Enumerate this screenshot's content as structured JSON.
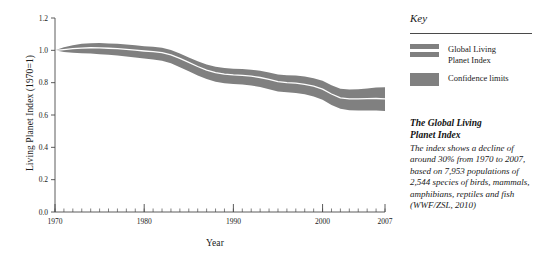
{
  "chart_data": {
    "type": "area",
    "title": "",
    "xlabel": "Year",
    "ylabel": "Living Planet Index (1970=1)",
    "xlim": [
      1970,
      2007
    ],
    "ylim": [
      0.0,
      1.2
    ],
    "grid": false,
    "legend_position": "right",
    "x_ticks": [
      "1970",
      "1980",
      "1990",
      "2000",
      "2007"
    ],
    "x_tick_values": [
      1970,
      1980,
      1990,
      2000,
      2007
    ],
    "x_minor_tick_step": 1,
    "y_ticks": [
      "0.0",
      "0.2",
      "0.4",
      "0.6",
      "0.8",
      "1.0",
      "1.2"
    ],
    "y_tick_values": [
      0.0,
      0.2,
      0.4,
      0.6,
      0.8,
      1.0,
      1.2
    ],
    "x": [
      1970,
      1971,
      1972,
      1973,
      1974,
      1975,
      1976,
      1977,
      1978,
      1979,
      1980,
      1981,
      1982,
      1983,
      1984,
      1985,
      1986,
      1987,
      1988,
      1989,
      1990,
      1991,
      1992,
      1993,
      1994,
      1995,
      1996,
      1997,
      1998,
      1999,
      2000,
      2001,
      2002,
      2003,
      2004,
      2005,
      2006,
      2007
    ],
    "series": [
      {
        "name": "Global Living Planet Index",
        "color": "#ffffff",
        "style": "line-on-band",
        "values": [
          1.0,
          1.005,
          1.01,
          1.014,
          1.016,
          1.015,
          1.013,
          1.01,
          1.006,
          1.001,
          0.996,
          0.992,
          0.986,
          0.972,
          0.95,
          0.925,
          0.9,
          0.878,
          0.862,
          0.853,
          0.848,
          0.845,
          0.84,
          0.832,
          0.82,
          0.806,
          0.8,
          0.797,
          0.79,
          0.778,
          0.76,
          0.73,
          0.706,
          0.7,
          0.7,
          0.701,
          0.702,
          0.7
        ]
      },
      {
        "name": "Confidence limits",
        "color": "#808080",
        "style": "band",
        "lower": [
          1.0,
          0.99,
          0.985,
          0.982,
          0.98,
          0.976,
          0.972,
          0.968,
          0.962,
          0.956,
          0.95,
          0.944,
          0.936,
          0.92,
          0.896,
          0.87,
          0.845,
          0.822,
          0.806,
          0.797,
          0.792,
          0.788,
          0.782,
          0.773,
          0.76,
          0.746,
          0.74,
          0.736,
          0.728,
          0.714,
          0.694,
          0.662,
          0.638,
          0.63,
          0.628,
          0.628,
          0.628,
          0.625
        ],
        "upper": [
          1.0,
          1.019,
          1.032,
          1.04,
          1.044,
          1.045,
          1.043,
          1.04,
          1.036,
          1.031,
          1.026,
          1.022,
          1.016,
          1.002,
          0.98,
          0.956,
          0.932,
          0.912,
          0.898,
          0.89,
          0.886,
          0.884,
          0.88,
          0.873,
          0.863,
          0.851,
          0.846,
          0.844,
          0.838,
          0.828,
          0.812,
          0.784,
          0.762,
          0.758,
          0.76,
          0.764,
          0.77,
          0.772
        ]
      }
    ]
  },
  "key": {
    "heading": "Key",
    "entries": [
      {
        "label": "Global Living\nPlanet Index",
        "label_line1": "Global Living",
        "label_line2": "Planet Index",
        "swatch": "band-with-line",
        "color": "#808080"
      },
      {
        "label": "Confidence limits",
        "label_line1": "Confidence limits",
        "label_line2": "",
        "swatch": "solid",
        "color": "#808080"
      }
    ]
  },
  "caption": {
    "title_line1": "The Global Living",
    "title_line2": "Planet Index",
    "body": "The index shows a decline of around 30% from 1970 to 2007, based on 7,953 populations of 2,544 species of birds, mammals, amphibians, reptiles and fish (WWF/ZSL, 2010)"
  },
  "axes": {
    "y_title": "Living Planet Index (1970=1)",
    "x_title": "Year"
  }
}
